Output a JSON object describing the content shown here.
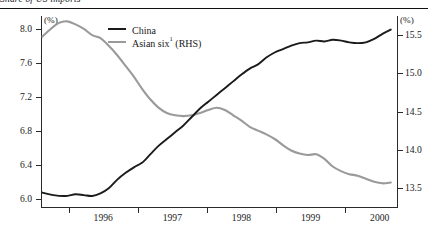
{
  "title": "Share of US imports",
  "axes": {
    "left_unit": "(%)",
    "right_unit": "(%)",
    "left_ticks": [
      "6.0",
      "6.4",
      "6.8",
      "7.2",
      "7.6",
      "8.0"
    ],
    "right_ticks": [
      "13.5",
      "14.0",
      "14.5",
      "15.0",
      "15.5"
    ],
    "x_ticks": [
      "1996",
      "1997",
      "1998",
      "1999",
      "2000"
    ]
  },
  "legend": {
    "china_label": "China",
    "asian_label": "Asian six",
    "asian_superscript": "1",
    "asian_suffix": " (RHS)"
  },
  "chart_data": {
    "type": "line",
    "title": "Share of US imports",
    "xlabel": "",
    "ylabel": "(%)",
    "y2label": "(%)",
    "ylim": [
      5.9,
      8.15
    ],
    "y2lim": [
      13.25,
      15.75
    ],
    "xlim": [
      1995.6,
      2000.75
    ],
    "grid": false,
    "legend_position": "top-center",
    "x_tick_values": [
      1996,
      1997,
      1998,
      1999,
      2000
    ],
    "left_tick_values": [
      6.0,
      6.4,
      6.8,
      7.2,
      7.6,
      8.0
    ],
    "right_tick_values": [
      13.5,
      14.0,
      14.5,
      15.0,
      15.5
    ],
    "series": [
      {
        "name": "China",
        "axis": "left",
        "color": "#1b1b1b",
        "x": [
          1995.62,
          1995.78,
          1995.95,
          1996.1,
          1996.22,
          1996.34,
          1996.46,
          1996.58,
          1996.7,
          1996.82,
          1996.95,
          1997.06,
          1997.18,
          1997.3,
          1997.42,
          1997.54,
          1997.66,
          1997.78,
          1997.9,
          1998.02,
          1998.14,
          1998.26,
          1998.38,
          1998.5,
          1998.62,
          1998.74,
          1998.86,
          1998.98,
          1999.1,
          1999.22,
          1999.34,
          1999.46,
          1999.58,
          1999.7,
          1999.82,
          1999.94,
          2000.06,
          2000.18,
          2000.3,
          2000.42,
          2000.54,
          2000.66
        ],
        "y": [
          6.07,
          6.04,
          6.03,
          6.05,
          6.04,
          6.03,
          6.06,
          6.12,
          6.22,
          6.3,
          6.37,
          6.42,
          6.52,
          6.62,
          6.7,
          6.78,
          6.86,
          6.96,
          7.06,
          7.14,
          7.22,
          7.3,
          7.38,
          7.46,
          7.53,
          7.58,
          7.66,
          7.72,
          7.76,
          7.8,
          7.83,
          7.84,
          7.86,
          7.85,
          7.87,
          7.86,
          7.84,
          7.83,
          7.84,
          7.88,
          7.94,
          7.99
        ]
      },
      {
        "name": "Asian six (RHS)",
        "axis": "right",
        "color": "#9a9a9a",
        "x": [
          1995.62,
          1995.74,
          1995.86,
          1995.98,
          1996.1,
          1996.22,
          1996.34,
          1996.46,
          1996.58,
          1996.7,
          1996.82,
          1996.94,
          1997.06,
          1997.18,
          1997.3,
          1997.42,
          1997.54,
          1997.66,
          1997.78,
          1997.9,
          1998.02,
          1998.14,
          1998.26,
          1998.38,
          1998.5,
          1998.62,
          1998.74,
          1998.86,
          1998.98,
          1999.1,
          1999.22,
          1999.34,
          1999.46,
          1999.58,
          1999.7,
          1999.82,
          1999.94,
          2000.06,
          2000.18,
          2000.3,
          2000.42,
          2000.54,
          2000.66
        ],
        "y": [
          15.48,
          15.58,
          15.66,
          15.68,
          15.64,
          15.58,
          15.5,
          15.46,
          15.36,
          15.24,
          15.1,
          14.96,
          14.8,
          14.66,
          14.55,
          14.48,
          14.45,
          14.44,
          14.45,
          14.48,
          14.52,
          14.55,
          14.52,
          14.45,
          14.38,
          14.3,
          14.25,
          14.2,
          14.14,
          14.06,
          13.99,
          13.95,
          13.93,
          13.94,
          13.88,
          13.78,
          13.72,
          13.68,
          13.66,
          13.62,
          13.58,
          13.56,
          13.57
        ]
      }
    ]
  }
}
